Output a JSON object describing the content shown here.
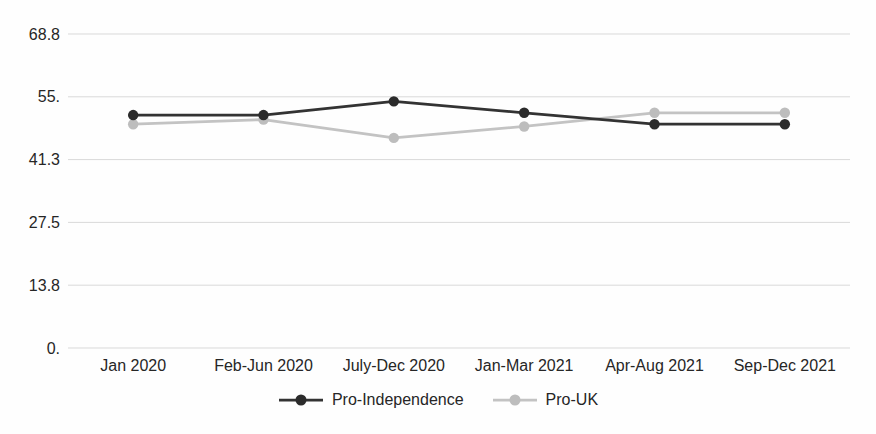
{
  "chart_data": {
    "type": "line",
    "title": "",
    "xlabel": "",
    "ylabel": "",
    "categories": [
      "Jan 2020",
      "Feb-Jun 2020",
      "July-Dec 2020",
      "Jan-Mar 2021",
      "Apr-Aug 2021",
      "Sep-Dec 2021"
    ],
    "series": [
      {
        "name": "Pro-Independence",
        "color": "#333333",
        "marker_color": "#2b2b2b",
        "values": [
          51,
          51,
          54,
          51.5,
          49,
          49
        ]
      },
      {
        "name": "Pro-UK",
        "color": "#c3c3c3",
        "marker_color": "#bdbdbd",
        "values": [
          49,
          50,
          46,
          48.5,
          51.5,
          51.5
        ]
      }
    ],
    "ylim": [
      0,
      68.75
    ],
    "yticks": {
      "values": [
        0,
        13.75,
        27.5,
        41.25,
        55,
        68.75
      ],
      "labels": [
        "0.",
        "13.8",
        "27.5",
        "41.3",
        "55.",
        "68.8"
      ]
    },
    "grid": true,
    "gridline_color": "#d9d9d9",
    "text_color": "#262626",
    "legend_position": "bottom"
  }
}
